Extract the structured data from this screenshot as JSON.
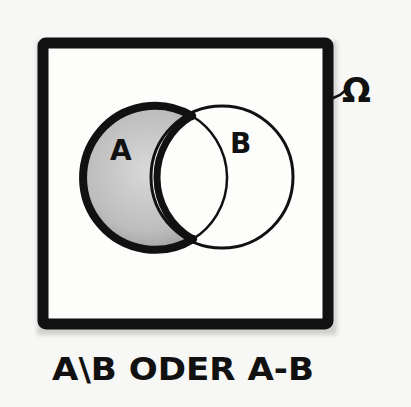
{
  "diagram": {
    "universe_label": "Ω",
    "set_a_label": "A",
    "set_b_label": "B",
    "caption": "A\\B ODER A-B",
    "shaded_region": "A minus B",
    "colors": {
      "ink": "#111111",
      "paper": "#f7f7f5",
      "box_fill": "#fdfdfc",
      "shade_light": "#dcdcdc",
      "shade_dark": "#9a9a9a"
    }
  }
}
